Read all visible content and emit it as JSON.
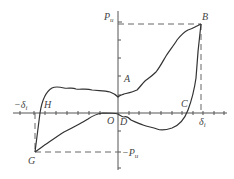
{
  "diagram": {
    "type": "hysteresis-loop",
    "labels": {
      "p_pos": {
        "main": "P",
        "sub": "u"
      },
      "p_neg": {
        "main": "−P",
        "sub": "u"
      },
      "delta_pos": {
        "main": "δ",
        "sub": "i"
      },
      "delta_neg": {
        "main": "−δ",
        "sub": "i"
      },
      "point_a": "A",
      "point_b": "B",
      "point_c": "C",
      "point_d": "D",
      "point_g": "G",
      "point_h": "H",
      "point_o": "O"
    },
    "colors": {
      "curve": "#333333",
      "axis": "#555555",
      "dashed": "#666666",
      "text": "#444444"
    }
  }
}
